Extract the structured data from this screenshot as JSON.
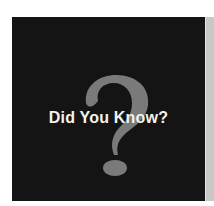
{
  "card": {
    "title": "Did You Know?",
    "icon": "question-mark-icon",
    "colors": {
      "background": "#141414",
      "icon": "#7a7a7a",
      "text": "#f2f2f2",
      "side_panel": "#c8c8c8"
    }
  }
}
